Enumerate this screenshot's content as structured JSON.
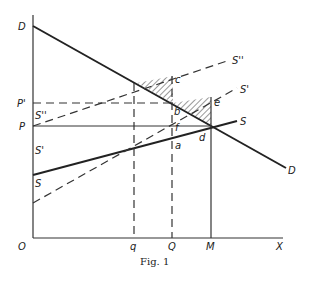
{
  "figure": {
    "caption": "Fig. 1",
    "axes": {
      "origin": "O",
      "x_axis": "X"
    },
    "curves": {
      "demand": {
        "left_label": "D",
        "right_label": "D"
      },
      "supply": {
        "left_label": "S",
        "right_label": "S"
      },
      "supply_prime": {
        "left_label": "S'",
        "right_label": "S'"
      },
      "supply_double_prime": {
        "left_label": "S''",
        "right_label": "S''"
      }
    },
    "price_labels": {
      "p_prime": "P'",
      "p": "P"
    },
    "quantity_labels": {
      "q": "q",
      "Q": "Q",
      "M": "M"
    },
    "points": {
      "a": "a",
      "b": "b",
      "c": "c",
      "d": "d",
      "e": "e",
      "f": "f"
    }
  }
}
